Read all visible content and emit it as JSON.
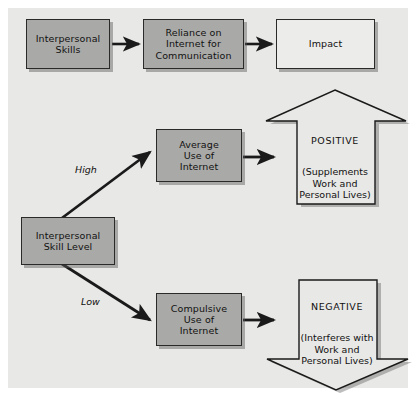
{
  "figure": {
    "background_color": "#e8e8e6",
    "box_fill_gray": "#a9a9a7",
    "box_fill_plain": "#ececeb",
    "line_color": "#1a1a1a"
  },
  "nodes": {
    "interpersonal_skills": {
      "label": "Interpersonal\nSkills",
      "fill": "gray"
    },
    "reliance": {
      "label": "Reliance on\nInternet for\nCommunication",
      "fill": "gray"
    },
    "impact": {
      "label": "Impact",
      "fill": "plain"
    },
    "skill_level": {
      "label": "Interpersonal\nSkill Level",
      "fill": "gray"
    },
    "average_use": {
      "label": "Average\nUse of\nInternet",
      "fill": "gray"
    },
    "compulsive_use": {
      "label": "Compulsive\nUse of\nInternet",
      "fill": "gray"
    }
  },
  "outcomes": {
    "positive": {
      "heading": "POSITIVE",
      "detail": "(Supplements\nWork and\nPersonal Lives)",
      "direction": "up"
    },
    "negative": {
      "heading": "NEGATIVE",
      "detail": "(Interferes with\nWork and\nPersonal Lives)",
      "direction": "down"
    }
  },
  "edge_labels": {
    "high": "High",
    "low": "Low"
  }
}
